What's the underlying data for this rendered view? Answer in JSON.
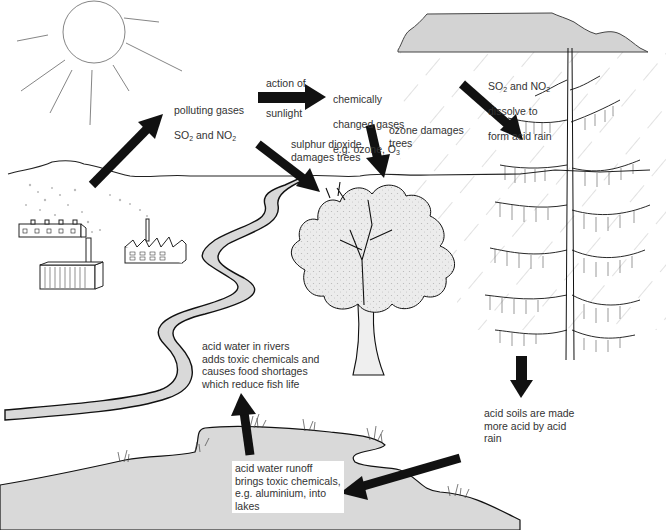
{
  "colors": {
    "ink": "#111111",
    "water_fill": "#d9d9d9",
    "cloud_fill": "#d4d4d4",
    "foliage_fill": "#e6e6e6",
    "text": "#333333",
    "rain": "#bdbdbd"
  },
  "labels": {
    "polluting_gases": {
      "line1": "polluting gases",
      "line2_a": "SO",
      "line2_sub1": "2",
      "line2_b": " and NO",
      "line2_sub2": "2"
    },
    "action_of": "action of",
    "sunlight": "sunlight",
    "chemically_changed": {
      "line1": "chemically",
      "line2": "changed gases",
      "line3_a": "e.g. ozone, O",
      "line3_sub": "3"
    },
    "dissolve": {
      "line1_a": "SO",
      "line1_sub1": "2",
      "line1_b": " and NO",
      "line1_sub2": "2",
      "line2": "dissolve to",
      "line3": "form acid rain"
    },
    "ozone_damages": "ozone damages\ntrees",
    "sulphur_damages": "sulphur dioxide\ndamages trees",
    "acid_rivers": "acid water in rivers\nadds toxic chemicals and\ncauses food shortages\nwhich reduce fish life",
    "acid_soils": "acid soils are made\nmore acid by acid\nrain",
    "acid_runoff": "acid water runoff\nbrings toxic chemicals,\ne.g. aluminium, into\nlakes"
  },
  "icons": {
    "sun": "sun-icon",
    "cloud": "rain-cloud-icon",
    "factories": "factory-icon",
    "deciduous_tree": "deciduous-tree-icon",
    "conifer_tree": "conifer-tree-icon",
    "river": "river-icon",
    "lake": "lake-icon"
  },
  "arrows": [
    {
      "id": "emission",
      "meaning": "factories emit gases"
    },
    {
      "id": "sunlight",
      "meaning": "action of sunlight"
    },
    {
      "id": "rain",
      "meaning": "gases dissolve into rain"
    },
    {
      "id": "sulphur",
      "meaning": "sulphur dioxide to trees"
    },
    {
      "id": "ozone",
      "meaning": "ozone to trees"
    },
    {
      "id": "soil",
      "meaning": "rain into soil"
    },
    {
      "id": "runoff",
      "meaning": "runoff into lake"
    },
    {
      "id": "river",
      "meaning": "lake to river"
    }
  ]
}
